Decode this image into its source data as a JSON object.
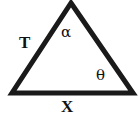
{
  "figure": {
    "type": "geometry-diagram",
    "shape": "triangle",
    "background_color": "#ffffff",
    "stroke_color": "#1a1a1a",
    "stroke_width": 5,
    "text_color": "#111111"
  },
  "vertices": {
    "apex": {
      "x": 71,
      "y": 3
    },
    "bottom_left": {
      "x": 12,
      "y": 93
    },
    "bottom_right": {
      "x": 133,
      "y": 93
    }
  },
  "labels": {
    "left_side": "T",
    "base": "X",
    "apex_angle": "α",
    "base_right_angle": "θ"
  },
  "chart_data": {
    "type": "diagram",
    "title": "",
    "annotations": [
      {
        "name": "side-label-T",
        "text": "T",
        "x": 24,
        "y": 42,
        "role": "side-length-left"
      },
      {
        "name": "side-label-X",
        "text": "X",
        "x": 67,
        "y": 106,
        "role": "side-length-base"
      },
      {
        "name": "angle-label-alpha",
        "text": "α",
        "x": 67,
        "y": 32,
        "role": "angle-at-apex"
      },
      {
        "name": "angle-label-theta",
        "text": "θ",
        "x": 101,
        "y": 75,
        "role": "angle-at-bottom-right"
      }
    ],
    "polygon": [
      [
        71,
        3
      ],
      [
        133,
        93
      ],
      [
        12,
        93
      ]
    ]
  }
}
